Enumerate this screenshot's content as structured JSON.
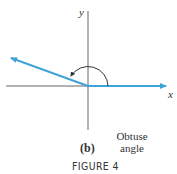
{
  "figure": {
    "x_axis_label": "x",
    "y_axis_label": "y",
    "sublabel": "(b)",
    "description_line1": "Obtuse",
    "description_line2": "angle",
    "caption": "FIGURE 4"
  },
  "colors": {
    "ray": "#3fa3d8",
    "axis": "#555555",
    "arc": "#333333"
  }
}
